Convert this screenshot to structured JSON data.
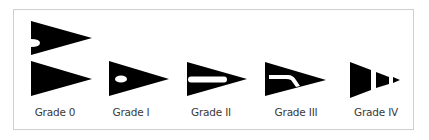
{
  "figure": {
    "type": "diagram",
    "colors": {
      "shape": "#000000",
      "background": "#ffffff",
      "border": "#cfcfcf",
      "label": "#3a3a3a"
    },
    "grades": [
      {
        "label": "Grade 0",
        "shape": "two-intact-triangles-one-with-notch"
      },
      {
        "label": "Grade I",
        "shape": "triangle-with-oval-hole"
      },
      {
        "label": "Grade II",
        "shape": "triangle-with-horizontal-slot"
      },
      {
        "label": "Grade III",
        "shape": "triangle-with-bent-slot"
      },
      {
        "label": "Grade IV",
        "shape": "fragmented-triangle-three-pieces"
      }
    ]
  }
}
